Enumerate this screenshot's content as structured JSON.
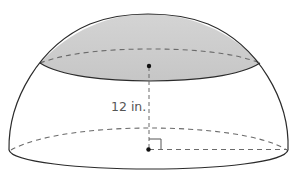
{
  "figure": {
    "type": "hemisphere-with-cap",
    "measurements": [
      {
        "label": "12 in.",
        "kind": "height",
        "from": "base-center",
        "to": "cap-center"
      }
    ],
    "colors": {
      "outline": "#2b2b2b",
      "dashed": "#6a6a6a",
      "cap_fill": "#cfcfcf",
      "cap_fill_light": "#e2e2e2",
      "background": "#ffffff",
      "label": "#555555"
    }
  }
}
